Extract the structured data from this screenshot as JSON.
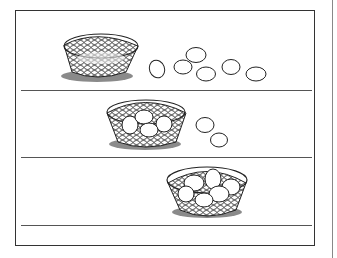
{
  "worksheet": {
    "type": "egg-counting-illustration",
    "colors": {
      "ink": "#222222",
      "shadow": "#8a8a8a",
      "frame": "#333333",
      "rule": "#555555",
      "background": "#ffffff"
    },
    "rows": [
      {
        "basket_eggs": 0,
        "loose_eggs": 6
      },
      {
        "basket_eggs": 4,
        "loose_eggs": 2
      },
      {
        "basket_eggs": 6,
        "loose_eggs": 0
      }
    ]
  }
}
